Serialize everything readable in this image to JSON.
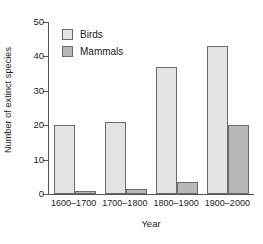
{
  "chart_data": {
    "type": "bar",
    "title": "",
    "xlabel": "Year",
    "ylabel": "Number of extinct species",
    "categories": [
      "1600–1700",
      "1700–1800",
      "1800–1900",
      "1900–2000"
    ],
    "series": [
      {
        "name": "Birds",
        "values": [
          20,
          21,
          37,
          43
        ],
        "color": "#e3e3e3"
      },
      {
        "name": "Mammals",
        "values": [
          1,
          1.5,
          3.5,
          20
        ],
        "color": "#b8b8b8"
      }
    ],
    "ylim": [
      0,
      50
    ],
    "yticks": [
      0,
      10,
      20,
      30,
      40,
      50
    ],
    "ytick_labels": [
      "0",
      "10",
      "20",
      "30",
      "40",
      "50"
    ],
    "grid": false,
    "legend_position": "upper left",
    "axis_color": "#555555",
    "bar_edge_color": "#6b6b6b"
  },
  "legend": {
    "items": [
      {
        "label": "Birds"
      },
      {
        "label": "Mammals"
      }
    ]
  }
}
